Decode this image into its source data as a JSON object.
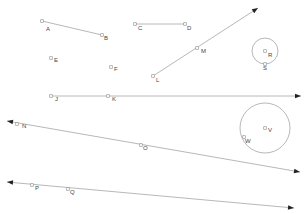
{
  "diagram": {
    "points": [
      {
        "id": "A",
        "label": "A",
        "x": 42,
        "y": 21,
        "lx": 46,
        "ly": 31
      },
      {
        "id": "B",
        "label": "B",
        "x": 102,
        "y": 35,
        "lx": 104,
        "ly": 40
      },
      {
        "id": "C",
        "label": "C",
        "x": 135,
        "y": 24,
        "lx": 138,
        "ly": 30
      },
      {
        "id": "D",
        "label": "D",
        "x": 185,
        "y": 24,
        "lx": 187,
        "ly": 30
      },
      {
        "id": "E",
        "label": "E",
        "x": 51,
        "y": 58,
        "lx": 54,
        "ly": 62
      },
      {
        "id": "F",
        "label": "F",
        "x": 111,
        "y": 67,
        "lx": 114,
        "ly": 71
      },
      {
        "id": "L",
        "label": "L",
        "x": 153,
        "y": 76,
        "lx": 156,
        "ly": 82
      },
      {
        "id": "M",
        "label": "M",
        "x": 197,
        "y": 48,
        "lx": 201,
        "ly": 53
      },
      {
        "id": "R",
        "label": "R",
        "x": 265,
        "y": 51,
        "lx": 268,
        "ly": 57
      },
      {
        "id": "S",
        "label": "S",
        "x": 265,
        "y": 64,
        "lx": 263,
        "ly": 70
      },
      {
        "id": "J",
        "label": "J",
        "x": 51,
        "y": 96,
        "lx": 55,
        "ly": 101
      },
      {
        "id": "K",
        "label": "K",
        "x": 108,
        "y": 96,
        "lx": 112,
        "ly": 101
      },
      {
        "id": "N",
        "label": "N",
        "x": 17,
        "y": 124,
        "lx": 22,
        "ly": 128
      },
      {
        "id": "O",
        "label": "O",
        "x": 141,
        "y": 145,
        "lx": 143,
        "ly": 150
      },
      {
        "id": "V",
        "label": "V",
        "x": 265,
        "y": 128,
        "lx": 268,
        "ly": 132
      },
      {
        "id": "W",
        "label": "W",
        "x": 244,
        "y": 137,
        "lx": 245,
        "ly": 143
      },
      {
        "id": "P",
        "label": "P",
        "x": 32,
        "y": 185,
        "lx": 35,
        "ly": 190
      },
      {
        "id": "Q",
        "label": "Q",
        "x": 68,
        "y": 189,
        "lx": 70,
        "ly": 194
      }
    ],
    "segments": [
      {
        "id": "AB",
        "x1": 42,
        "y1": 21,
        "x2": 102,
        "y2": 35
      },
      {
        "id": "CD",
        "x1": 135,
        "y1": 24,
        "x2": 185,
        "y2": 24
      }
    ],
    "rays": [
      {
        "id": "LM",
        "x1": 153,
        "y1": 76,
        "x2": 258,
        "y2": 8
      },
      {
        "id": "JK",
        "x1": 51,
        "y1": 96,
        "x2": 301,
        "y2": 96
      }
    ],
    "lines": [
      {
        "id": "NO",
        "x1": 7,
        "y1": 121,
        "x2": 300,
        "y2": 172
      },
      {
        "id": "PQ",
        "x1": 7,
        "y1": 182,
        "x2": 294,
        "y2": 208
      }
    ],
    "circles": [
      {
        "id": "circle-R",
        "cx": 265,
        "cy": 51,
        "r": 13
      },
      {
        "id": "circle-V",
        "cx": 265,
        "cy": 128,
        "r": 25
      }
    ],
    "colors": {
      "stroke": "#b8b8b8",
      "arrow": "#222222",
      "label": "#444444"
    }
  }
}
